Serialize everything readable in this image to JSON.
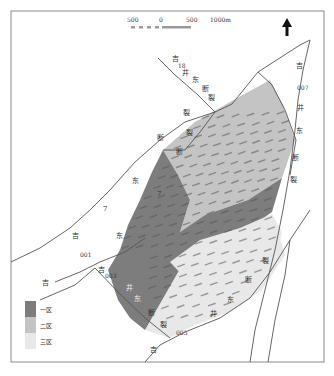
{
  "scale_bar": {
    "labels": [
      "500",
      "0",
      "500",
      "1000m"
    ]
  },
  "north_arrow": {
    "icon": "north-arrow-icon"
  },
  "faults": {
    "ji18_east": {
      "chars": [
        "吉",
        "18",
        "井",
        "东",
        "断",
        "裂"
      ]
    },
    "ji7_east": {
      "chars": [
        "吉",
        "井",
        "东",
        "7",
        "断",
        "裂",
        "裂",
        "断"
      ]
    },
    "ji007_east": {
      "chars": [
        "吉",
        "007",
        "井",
        "东",
        "断",
        "裂"
      ]
    },
    "ji001": {
      "chars": [
        "001",
        "吉",
        "井"
      ]
    },
    "ji003": {
      "chars": [
        "吉",
        "003",
        "井",
        "东",
        "断",
        "裂"
      ]
    },
    "ji005": {
      "chars": [
        "吉",
        "005",
        "井",
        "东",
        "断",
        "裂"
      ]
    }
  },
  "legend": {
    "items": [
      {
        "label": "一区",
        "color": "#7d7d7d"
      },
      {
        "label": "二区",
        "color": "#c4c4c4"
      },
      {
        "label": "三区",
        "color": "#e8e8e8"
      }
    ]
  },
  "zones": {
    "zone1_color": "#7d7d7d",
    "zone2_color": "#c4c4c4",
    "zone3_color": "#e8e8e8"
  }
}
